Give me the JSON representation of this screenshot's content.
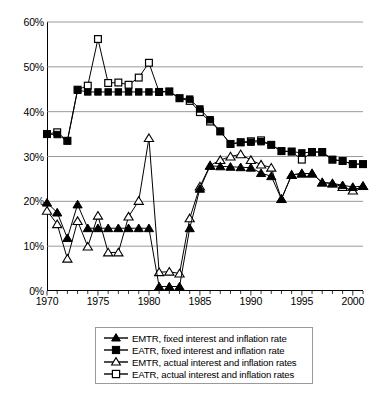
{
  "chart_data": {
    "type": "line",
    "title": "",
    "subtitle": "",
    "xlabel": "",
    "ylabel": "",
    "xlim": [
      1970,
      2001
    ],
    "ylim": [
      0,
      60
    ],
    "y_tick_labels": [
      "0%",
      "10%",
      "20%",
      "30%",
      "40%",
      "50%",
      "60%"
    ],
    "y_ticks": [
      0,
      10,
      20,
      30,
      40,
      50,
      60
    ],
    "x_tick_labels": [
      "1970",
      "1975",
      "1980",
      "1985",
      "1990",
      "1995",
      "2000"
    ],
    "x_ticks": [
      1970,
      1975,
      1980,
      1985,
      1990,
      1995,
      2000
    ],
    "x_minor_tick_interval": 1,
    "grid": "horizontal",
    "grid_color": "#808080",
    "legend_position": "bottom",
    "line_color": "#000000",
    "x": [
      1970,
      1971,
      1972,
      1973,
      1974,
      1975,
      1976,
      1977,
      1978,
      1979,
      1980,
      1981,
      1982,
      1983,
      1984,
      1985,
      1986,
      1987,
      1988,
      1989,
      1990,
      1991,
      1992,
      1993,
      1994,
      1995,
      1996,
      1997,
      1998,
      1999,
      2000,
      2001
    ],
    "series": [
      {
        "name": "EMTR, fixed interest and inflation rate",
        "marker": "filled-triangle",
        "values": [
          19.7,
          17.5,
          11.8,
          19.3,
          14.0,
          14.0,
          14.0,
          14.0,
          14.0,
          14.0,
          14.0,
          1.0,
          1.0,
          1.0,
          14.0,
          22.8,
          27.9,
          27.8,
          27.7,
          27.6,
          27.5,
          26.3,
          25.6,
          20.5,
          25.9,
          26.2,
          26.2,
          24.2,
          24.0,
          23.6,
          23.2,
          23.4
        ]
      },
      {
        "name": "EATR, fixed interest and inflation rate",
        "marker": "filled-square",
        "values": [
          35.0,
          34.9,
          33.5,
          44.8,
          44.4,
          44.4,
          44.4,
          44.4,
          44.4,
          44.4,
          44.4,
          44.4,
          44.5,
          43.0,
          42.8,
          40.6,
          38.2,
          35.6,
          32.8,
          33.1,
          33.2,
          33.3,
          32.6,
          31.2,
          31.1,
          30.8,
          31.0,
          31.0,
          29.3,
          29.0,
          28.3,
          28.3
        ]
      },
      {
        "name": "EMTR, actual interest and inflation rates",
        "marker": "open-triangle",
        "values": [
          17.9,
          14.9,
          7.2,
          15.6,
          9.9,
          16.8,
          8.6,
          8.6,
          16.6,
          20.1,
          34.1,
          4.2,
          4.3,
          3.9,
          16.2,
          23.3,
          28.0,
          29.2,
          30.0,
          30.5,
          29.2,
          28.2,
          27.5,
          20.5,
          25.9,
          26.2,
          26.2,
          24.2,
          24.0,
          23.2,
          22.4,
          23.4
        ]
      },
      {
        "name": "EATR, actual interest and inflation rates",
        "marker": "open-square",
        "values": [
          35.0,
          35.4,
          33.5,
          44.9,
          45.8,
          56.2,
          46.4,
          46.5,
          46.0,
          47.6,
          50.9,
          44.4,
          44.5,
          43.0,
          42.4,
          39.9,
          37.8,
          35.6,
          32.8,
          33.2,
          33.4,
          33.6,
          32.6,
          31.2,
          31.1,
          29.3,
          31.0,
          31.0,
          29.3,
          29.0,
          28.3,
          28.3
        ]
      }
    ]
  },
  "legend": {
    "items": [
      {
        "label": "EMTR, fixed interest and inflation rate",
        "marker": "filled-triangle"
      },
      {
        "label": "EATR, fixed interest and inflation rate",
        "marker": "filled-square"
      },
      {
        "label": "EMTR, actual interest and inflation rates",
        "marker": "open-triangle"
      },
      {
        "label": "EATR, actual interest and inflation rates",
        "marker": "open-square"
      }
    ]
  }
}
